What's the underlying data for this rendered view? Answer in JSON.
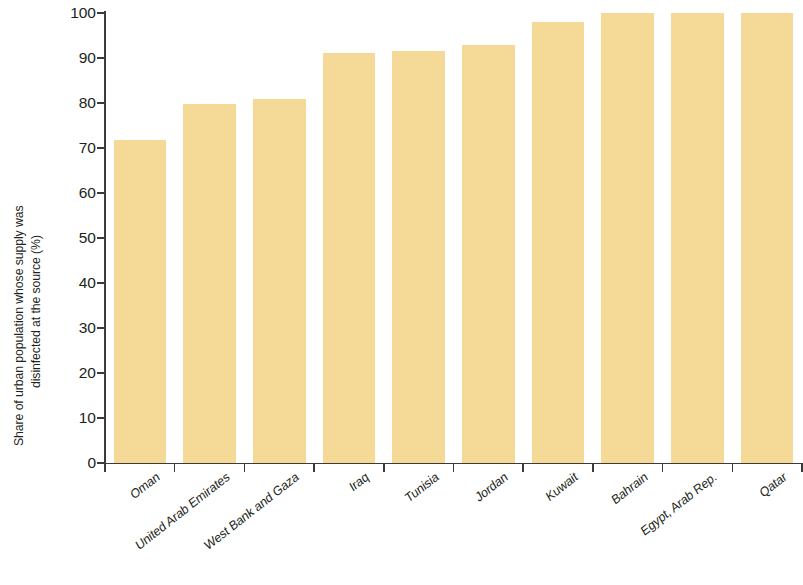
{
  "chart_data": {
    "type": "bar",
    "title": "",
    "subtitle": "",
    "xlabel": "",
    "ylabel": "Share of urban population whose supply was disinfected at the source (%)",
    "ylabel_lines": [
      "Share of urban population whose supply was",
      "disinfected at the source (%)"
    ],
    "categories": [
      "Oman",
      "United Arab Emirates",
      "West Bank and Gaza",
      "Iraq",
      "Tunisia",
      "Jordan",
      "Kuwait",
      "Bahrain",
      "Egypt, Arab Rep.",
      "Qatar"
    ],
    "values": [
      71.8,
      79.8,
      80.9,
      91.1,
      91.6,
      92.8,
      98.1,
      99.9,
      99.9,
      99.9
    ],
    "ylim": [
      0,
      100
    ],
    "yticks": [
      0,
      10,
      20,
      30,
      40,
      50,
      60,
      70,
      80,
      90,
      100
    ],
    "ytick_labels": [
      "0",
      "10",
      "20",
      "30",
      "40",
      "50",
      "60",
      "70",
      "80",
      "90",
      "100"
    ],
    "grid": false,
    "legend": false,
    "legend_position": "none",
    "bar_color": "#f4da96",
    "axis_color": "#3b3b3b",
    "text_color": "#231f20",
    "background_color": "#ffffff"
  }
}
